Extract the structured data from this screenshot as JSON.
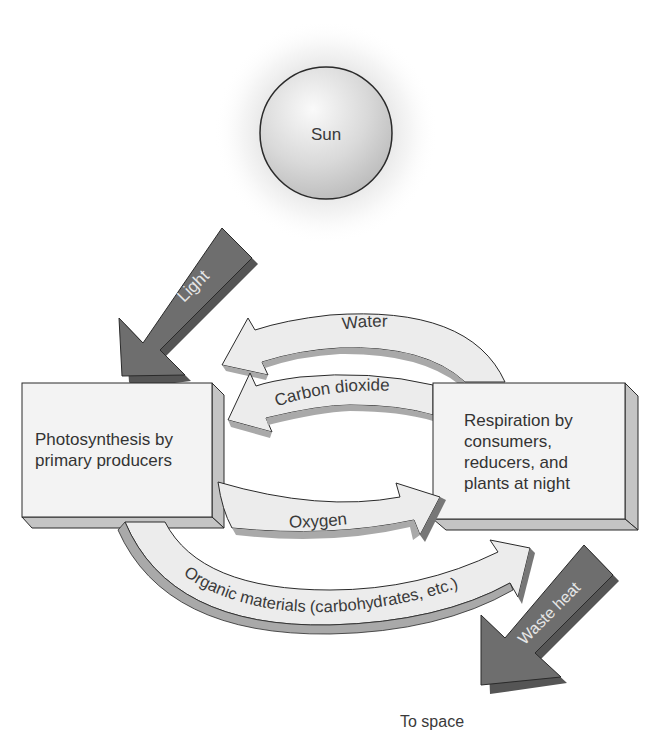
{
  "diagram": {
    "sun": {
      "label": "Sun"
    },
    "boxes": {
      "photosynthesis": {
        "lines": [
          "Photosynthesis by",
          "primary producers"
        ]
      },
      "respiration": {
        "lines": [
          "Respiration by",
          "consumers,",
          "reducers, and",
          "plants at night"
        ]
      }
    },
    "arrows": {
      "light": {
        "label": "Light",
        "from": "Sun",
        "to": "Photosynthesis by primary producers"
      },
      "water": {
        "label": "Water",
        "from": "Respiration",
        "to": "Photosynthesis"
      },
      "carbon_dioxide": {
        "label": "Carbon dioxide",
        "from": "Respiration",
        "to": "Photosynthesis"
      },
      "oxygen": {
        "label": "Oxygen",
        "from": "Photosynthesis",
        "to": "Respiration"
      },
      "organic_materials": {
        "label": "Organic materials (carbohydrates, etc.)",
        "from": "Photosynthesis",
        "to": "Respiration"
      },
      "waste_heat": {
        "label": "Waste heat",
        "from": "Respiration",
        "to": "To space"
      }
    },
    "destination": {
      "label": "To space"
    },
    "colors": {
      "dark_arrow": "#6e6e6e",
      "dark_arrow_side": "#555555",
      "light_arrow": "#ececec",
      "light_arrow_side": "#a9a9a9",
      "box_face": "#f3f3f3",
      "box_side": "#c4c4c4",
      "outline": "#2a2a2a"
    }
  }
}
